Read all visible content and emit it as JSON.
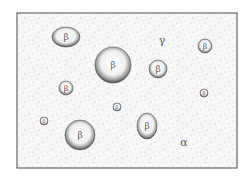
{
  "diagram": {
    "type": "microstructure",
    "frame": {
      "x": 17,
      "y": 13,
      "w": 220,
      "h": 155
    },
    "matrix_phase_label": "α",
    "other_labels": [
      {
        "text": "γ",
        "x": 162,
        "y": 44
      },
      {
        "text": "α",
        "x": 184,
        "y": 146
      }
    ],
    "particle_label": "β",
    "particles": [
      {
        "cx": 66,
        "cy": 37,
        "rx": 14,
        "ry": 10,
        "fs": 9
      },
      {
        "cx": 113,
        "cy": 65,
        "rx": 18,
        "ry": 18,
        "fs": 9
      },
      {
        "cx": 158,
        "cy": 69,
        "rx": 9,
        "ry": 9,
        "fs": 9
      },
      {
        "cx": 205,
        "cy": 46,
        "rx": 7,
        "ry": 7,
        "fs": 8
      },
      {
        "cx": 66,
        "cy": 88,
        "rx": 7,
        "ry": 7,
        "fs": 8
      },
      {
        "cx": 117,
        "cy": 107,
        "rx": 4,
        "ry": 4,
        "fs": 5
      },
      {
        "cx": 204,
        "cy": 93,
        "rx": 4,
        "ry": 4,
        "fs": 5
      },
      {
        "cx": 44,
        "cy": 121,
        "rx": 4,
        "ry": 4,
        "fs": 5
      },
      {
        "cx": 80,
        "cy": 135,
        "rx": 15,
        "ry": 15,
        "fs": 9
      },
      {
        "cx": 147,
        "cy": 126,
        "rx": 10,
        "ry": 13,
        "fs": 9
      }
    ],
    "colors": {
      "frame": "#666666",
      "background": "#f7f7f7",
      "speckle": "#8a8a8a",
      "particle_edge": "#555555"
    }
  }
}
